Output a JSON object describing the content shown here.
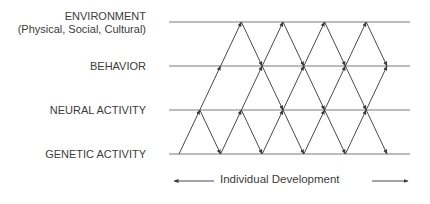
{
  "diagram": {
    "levels": [
      {
        "id": "environment",
        "label": "ENVIRONMENT",
        "sublabel": "(Physical, Social, Cultural)"
      },
      {
        "id": "behavior",
        "label": "BEHAVIOR"
      },
      {
        "id": "neural",
        "label": "NEURAL ACTIVITY"
      },
      {
        "id": "genetic",
        "label": "GENETIC ACTIVITY"
      }
    ],
    "timeline": {
      "label": "Individual Development",
      "direction": "bidirectional"
    },
    "edge_color": "#4a4a4a",
    "line_color": "#7a7a7a"
  }
}
